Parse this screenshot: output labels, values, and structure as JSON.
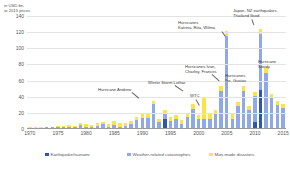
{
  "axis_caption": "in USD bn,\nat 2015 prices",
  "legend": [
    {
      "label": "Earthquake/tsunami",
      "color": "#2f55b0",
      "key": "quake"
    },
    {
      "label": "Weather-related catastrophes",
      "color": "#8fa9e8",
      "key": "weather"
    },
    {
      "label": "Man-made disasters",
      "color": "#ffe14d",
      "key": "man"
    }
  ],
  "annotations": [
    {
      "id": "hurricane-andrew",
      "text": "Hurricane Andrew"
    },
    {
      "id": "winter-storm-lothar",
      "text": "Winter Storm Lothar"
    },
    {
      "id": "wtc",
      "text": "WTC"
    },
    {
      "id": "hurricanes-ivan-charley-frances",
      "text": "Hurricanes Ivan,\nCharley, Frances"
    },
    {
      "id": "hurricanes-katrina-rita-wilma",
      "text": "Hurricanes\nKatrina, Rita, Wilma"
    },
    {
      "id": "hurricanes-ike-gustav",
      "text": "Hurricanes\nIke, Gustav"
    },
    {
      "id": "japan-nz-earthquakes-thailand-flood",
      "text": "Japan, NZ earthquakes,\nThailand flood"
    },
    {
      "id": "hurricane-sandy",
      "text": "Hurricane\nSandy"
    }
  ],
  "chart_data": {
    "type": "bar",
    "subtype": "stacked",
    "title": "",
    "xlabel": "",
    "ylabel": "in USD bn, at 2015 prices",
    "ylim": [
      0,
      140
    ],
    "yticks": [
      0,
      20,
      40,
      60,
      80,
      100,
      120,
      140
    ],
    "xticks": [
      1970,
      1975,
      1980,
      1985,
      1990,
      1995,
      2000,
      2005,
      2010,
      2015
    ],
    "grid": true,
    "legend_position": "bottom",
    "categories": [
      1970,
      1971,
      1972,
      1973,
      1974,
      1975,
      1976,
      1977,
      1978,
      1979,
      1980,
      1981,
      1982,
      1983,
      1984,
      1985,
      1986,
      1987,
      1988,
      1989,
      1990,
      1991,
      1992,
      1993,
      1994,
      1995,
      1996,
      1997,
      1998,
      1999,
      2000,
      2001,
      2002,
      2003,
      2004,
      2005,
      2006,
      2007,
      2008,
      2009,
      2010,
      2011,
      2012,
      2013,
      2014,
      2015
    ],
    "series": [
      {
        "name": "Earthquake/tsunami",
        "color": "#2f55b0",
        "values": [
          0,
          0,
          0,
          0,
          0,
          0,
          0,
          0,
          0,
          0,
          0,
          0,
          0,
          0,
          0,
          0,
          0,
          0,
          0,
          1,
          0,
          0,
          0,
          0,
          13,
          0,
          0,
          0,
          0,
          0,
          0,
          0,
          0,
          0,
          0,
          0,
          0,
          0,
          0,
          0,
          9,
          48,
          0,
          0,
          0,
          0
        ]
      },
      {
        "name": "Weather-related catastrophes",
        "color": "#8fa9e8",
        "values": [
          1,
          1,
          1,
          2,
          2,
          2,
          2,
          3,
          2,
          5,
          3,
          2,
          4,
          6,
          3,
          5,
          3,
          4,
          6,
          10,
          14,
          14,
          31,
          9,
          7,
          10,
          12,
          6,
          15,
          25,
          12,
          13,
          13,
          18,
          47,
          115,
          13,
          28,
          47,
          24,
          32,
          70,
          70,
          38,
          30,
          26
        ]
      },
      {
        "name": "Man-made disasters",
        "color": "#ffe14d",
        "values": [
          1,
          1,
          1,
          1,
          1,
          2,
          2,
          2,
          2,
          3,
          3,
          3,
          4,
          3,
          3,
          5,
          4,
          4,
          4,
          4,
          4,
          4,
          4,
          4,
          4,
          5,
          5,
          5,
          5,
          6,
          5,
          26,
          6,
          6,
          6,
          7,
          6,
          6,
          6,
          5,
          5,
          6,
          7,
          6,
          5,
          5
        ]
      }
    ]
  }
}
